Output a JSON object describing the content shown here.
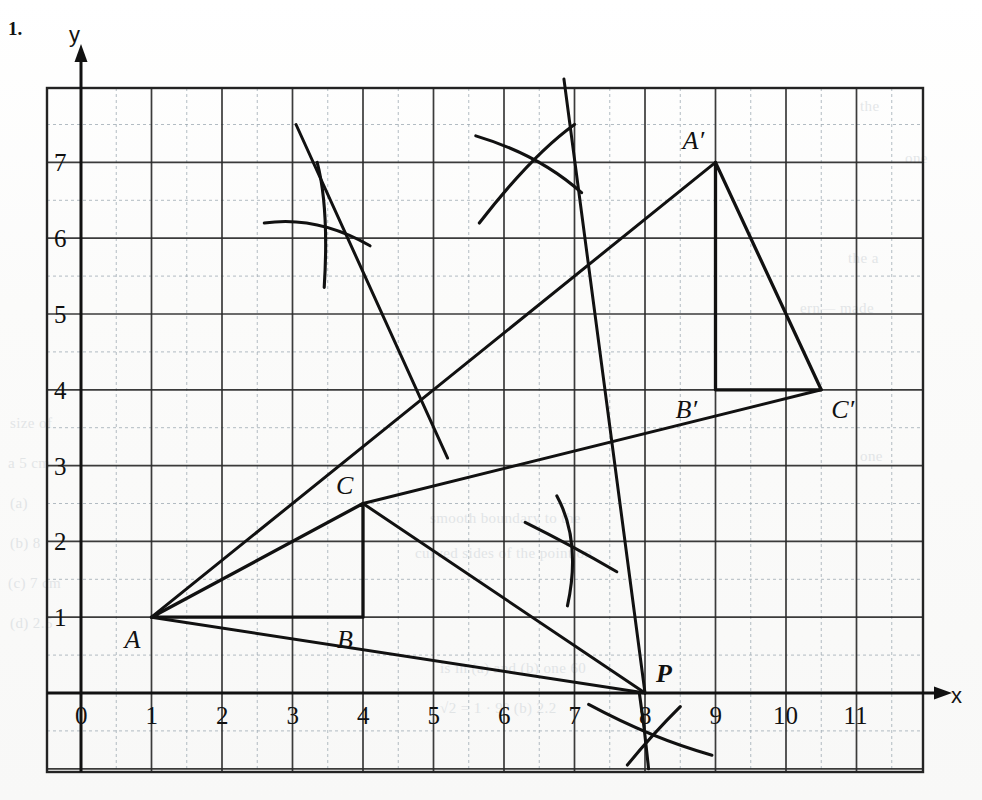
{
  "question_number": "1.",
  "axes": {
    "x_label": "x",
    "y_label": "y",
    "x_ticks": [
      "0",
      "1",
      "2",
      "3",
      "4",
      "5",
      "6",
      "7",
      "8",
      "9",
      "10",
      "11"
    ],
    "y_ticks": [
      "1",
      "2",
      "3",
      "4",
      "5",
      "6",
      "7"
    ],
    "x_range": [
      -0.5,
      11.9
    ],
    "y_range": [
      -0.9,
      8.0
    ],
    "origin_label": "0"
  },
  "grid": {
    "major_color": "#2b2b2b",
    "minor_color": "#9aa7b0",
    "minor_style": "dashed",
    "unit_px": 70.5,
    "major_every": 1,
    "minor_every": 0.5
  },
  "ink_color": "#111111",
  "chart_data": {
    "type": "scatter",
    "title": "",
    "xlabel": "x",
    "ylabel": "y",
    "xlim": [
      0,
      11.9
    ],
    "ylim": [
      0,
      8
    ],
    "grid": true,
    "legend": "none",
    "points": [
      {
        "label": "A",
        "x": 1,
        "y": 1
      },
      {
        "label": "B",
        "x": 4,
        "y": 1
      },
      {
        "label": "C",
        "x": 4,
        "y": 2.5
      },
      {
        "label": "A'",
        "x": 9,
        "y": 7
      },
      {
        "label": "B'",
        "x": 9,
        "y": 4
      },
      {
        "label": "C'",
        "x": 10.5,
        "y": 4
      },
      {
        "label": "P",
        "x": 8,
        "y": 0
      }
    ],
    "shapes": [
      {
        "name": "triangle-ABC",
        "vertices": [
          [
            1,
            1
          ],
          [
            4,
            1
          ],
          [
            4,
            2.5
          ]
        ],
        "closed": true
      },
      {
        "name": "triangle-A'B'C'",
        "vertices": [
          [
            9,
            7
          ],
          [
            9,
            4
          ],
          [
            10.5,
            4
          ]
        ],
        "closed": true
      }
    ],
    "rays": [
      {
        "name": "ray-P-through-A-to-A'",
        "from": [
          8,
          0
        ],
        "to": [
          9,
          7
        ],
        "through": [
          1,
          1
        ]
      },
      {
        "name": "ray-P-through-C-to-C'",
        "from": [
          8,
          0
        ],
        "to": [
          10.5,
          4
        ],
        "through": [
          4,
          2.5
        ]
      }
    ],
    "construction_arc_crossings": [
      {
        "name": "arc-cross-upper-left",
        "x": 3.4,
        "y": 6.35
      },
      {
        "name": "arc-cross-upper-right",
        "x": 6.45,
        "y": 7.05
      },
      {
        "name": "arc-cross-mid-right",
        "x": 6.95,
        "y": 1.95
      },
      {
        "name": "arc-cross-below-P",
        "x": 8.05,
        "y": -0.6
      }
    ]
  },
  "labels": {
    "A": "A",
    "B": "B",
    "C": "C",
    "A_prime": "A′",
    "B_prime": "B′",
    "C_prime": "C′",
    "P": "P"
  },
  "ghost_text": [
    {
      "t": "the",
      "x": 860,
      "y": 98
    },
    {
      "t": "one",
      "x": 905,
      "y": 150
    },
    {
      "t": "the a",
      "x": 848,
      "y": 250
    },
    {
      "t": "ern— made",
      "x": 800,
      "y": 300
    },
    {
      "t": "size of",
      "x": 10,
      "y": 415
    },
    {
      "t": "a 5 cm",
      "x": 8,
      "y": 455
    },
    {
      "t": "(a)",
      "x": 10,
      "y": 495
    },
    {
      "t": "(b) 8",
      "x": 10,
      "y": 535
    },
    {
      "t": "(c) 7 cm",
      "x": 8,
      "y": 575
    },
    {
      "t": "(d) 2.5",
      "x": 10,
      "y": 615
    },
    {
      "t": "smooth boundary to the",
      "x": 430,
      "y": 510
    },
    {
      "t": "curved sides of the point on",
      "x": 415,
      "y": 545
    },
    {
      "t": "one",
      "x": 860,
      "y": 448
    },
    {
      "t": "is in (a) and (b) one 60",
      "x": 440,
      "y": 660
    },
    {
      "t": "√2 = 1 · 9° (b) 2.2",
      "x": 440,
      "y": 700
    }
  ]
}
